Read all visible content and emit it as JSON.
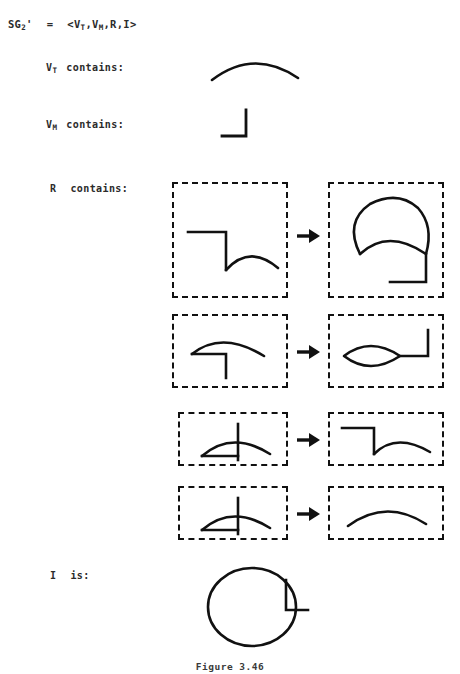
{
  "header": {
    "grammar_name": "SG",
    "grammar_subscript": "2",
    "grammar_prime": "'",
    "equals": "=",
    "tuple": "<V",
    "tuple_sub1": "T",
    "tuple_mid": ",V",
    "tuple_sub2": "M",
    "tuple_tail": ",R,I>"
  },
  "rows": {
    "vt_label": "V",
    "vt_sub": "T",
    "vt_text": "contains:",
    "vm_label": "V",
    "vm_sub": "M",
    "vm_text": "contains:",
    "r_label": "R",
    "r_text": "contains:",
    "i_label": "I",
    "i_text": "is:"
  },
  "shapes": {
    "vt": "arc-dome",
    "vm": "right-angle-corner",
    "initial": "circle-with-notch-and-tail"
  },
  "rules": [
    {
      "index": 1,
      "lhs_shape": "step-with-arc",
      "rhs_shape": "closed-loop-with-inner-arc-and-step-tail",
      "arrow": "➜"
    },
    {
      "index": 2,
      "lhs_shape": "arc-over-corner",
      "rhs_shape": "lens-with-step-tail",
      "arrow": "➜"
    },
    {
      "index": 3,
      "lhs_shape": "arc-with-crossing-vertical",
      "rhs_shape": "step-with-arc",
      "arrow": "➜"
    },
    {
      "index": 4,
      "lhs_shape": "arc-with-crossing-vertical",
      "rhs_shape": "arc-dome",
      "arrow": "➜"
    }
  ],
  "caption": {
    "text": "Figure 3.46"
  },
  "colors": {
    "ink": "#111111",
    "text": "#2b2b2b",
    "background": "#ffffff"
  }
}
